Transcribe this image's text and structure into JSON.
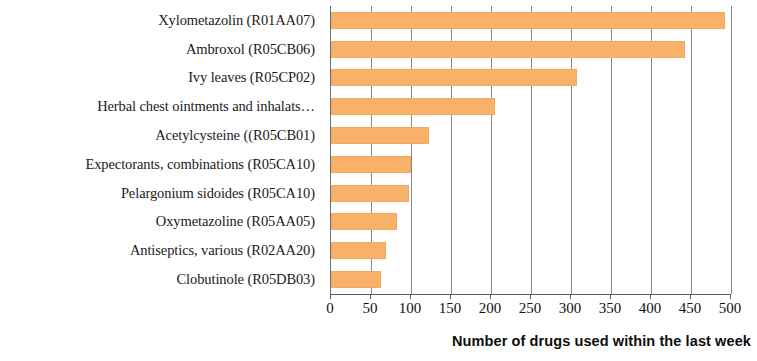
{
  "chart_data": {
    "type": "bar",
    "orientation": "horizontal",
    "title": "",
    "xlabel": "Number of drugs used within the last week",
    "ylabel": "",
    "xlim": [
      0,
      500
    ],
    "xticks": [
      0,
      50,
      100,
      150,
      200,
      250,
      300,
      350,
      400,
      450,
      500
    ],
    "xtick_labels": [
      "0",
      "50",
      "100",
      "150",
      "200",
      "250",
      "300",
      "350",
      "400",
      "450",
      "500"
    ],
    "grid": "vertical",
    "legend": "none",
    "bar_color": "#f7b168",
    "categories": [
      "Xylometazolin (R01AA07)",
      "Ambroxol (R05CB06)",
      "Ivy leaves (R05CP02)",
      "Herbal chest ointments and inhalats…",
      "Acetylcysteine ((R05CB01)",
      "Expectorants, combinations (R05CA10)",
      "Pelargonium sidoides (R05CA10)",
      "Oxymetazoline (R05AA05)",
      "Antiseptics, various (R02AA20)",
      "Clobutinole (R05DB03)"
    ],
    "values": [
      492,
      443,
      307,
      205,
      122,
      100,
      98,
      82,
      69,
      63
    ]
  }
}
